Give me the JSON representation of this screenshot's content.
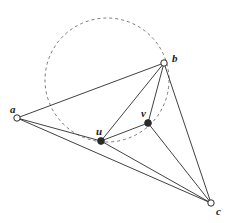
{
  "figure": {
    "width": 229,
    "height": 223,
    "background": "#ffffff",
    "stroke_color": "#2b2b2b",
    "dashed_color": "#6b6b6b",
    "label_color": "#1b1b1b",
    "line_width": 0.9,
    "dashed_width": 0.9,
    "dash_pattern": "3 3"
  },
  "chart_data": {
    "type": "scatter",
    "title": "",
    "xlabel": "",
    "ylabel": "",
    "xlim": [
      0,
      229
    ],
    "ylim": [
      223,
      0
    ],
    "grid": false,
    "legend": "none",
    "points": [
      {
        "id": "a",
        "label": "a",
        "x": 17,
        "y": 118,
        "marker": "open-circle",
        "radius": 3.2,
        "label_x": 10,
        "label_y": 104
      },
      {
        "id": "b",
        "label": "b",
        "x": 164,
        "y": 63,
        "marker": "open-circle",
        "radius": 3.2,
        "label_x": 172,
        "label_y": 53
      },
      {
        "id": "c",
        "label": "c",
        "x": 211,
        "y": 203,
        "marker": "open-circle",
        "radius": 3.2,
        "label_x": 216,
        "label_y": 206
      },
      {
        "id": "u",
        "label": "u",
        "x": 101,
        "y": 141,
        "marker": "filled-circle",
        "radius": 3.4,
        "label_x": 96,
        "label_y": 126
      },
      {
        "id": "v",
        "label": "v",
        "x": 148,
        "y": 123,
        "marker": "filled-circle",
        "radius": 3.4,
        "label_x": 141,
        "label_y": 108
      }
    ],
    "edges": [
      {
        "id": "edge-a-b",
        "from": "a",
        "to": "b",
        "style": "solid"
      },
      {
        "id": "edge-a-u",
        "from": "a",
        "to": "u",
        "style": "solid"
      },
      {
        "id": "edge-a-c",
        "from": "a",
        "to": "c",
        "style": "solid"
      },
      {
        "id": "edge-b-u",
        "from": "b",
        "to": "u",
        "style": "solid"
      },
      {
        "id": "edge-b-v",
        "from": "b",
        "to": "v",
        "style": "solid"
      },
      {
        "id": "edge-b-c",
        "from": "b",
        "to": "c",
        "style": "solid"
      },
      {
        "id": "edge-u-v",
        "from": "u",
        "to": "v",
        "style": "solid"
      },
      {
        "id": "edge-u-c",
        "from": "u",
        "to": "c",
        "style": "solid"
      },
      {
        "id": "edge-v-c",
        "from": "v",
        "to": "c",
        "style": "solid"
      }
    ],
    "circles": [
      {
        "id": "circumcircle-buv",
        "cx": 107,
        "cy": 80,
        "r": 62,
        "style": "dashed",
        "through": [
          "b",
          "u",
          "v"
        ]
      }
    ]
  }
}
